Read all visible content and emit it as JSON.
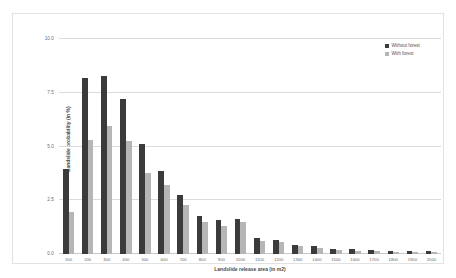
{
  "chart_data": {
    "type": "bar",
    "title": "",
    "subtitle": "",
    "xlabel": "Landslide release area (in m2)",
    "ylabel": "Landslide probability (in %)",
    "categories": [
      "100",
      "200",
      "300",
      "400",
      "500",
      "600",
      "700",
      "800",
      "900",
      "1000",
      "1100",
      "1200",
      "1300",
      "1400",
      "1500",
      "1600",
      "1700",
      "1800",
      "1900",
      "2000"
    ],
    "series": [
      {
        "name": "Without forest",
        "color": "#3b3b3b",
        "values": [
          3.95,
          8.2,
          8.3,
          7.2,
          5.1,
          3.85,
          2.75,
          1.75,
          1.6,
          1.65,
          0.75,
          0.65,
          0.4,
          0.35,
          0.25,
          0.22,
          0.18,
          0.16,
          0.14,
          0.12
        ]
      },
      {
        "name": "With forest",
        "color": "#b6b6b6",
        "values": [
          1.95,
          5.3,
          5.95,
          5.25,
          3.75,
          3.2,
          2.3,
          1.5,
          1.3,
          1.5,
          0.6,
          0.55,
          0.35,
          0.28,
          0.18,
          0.15,
          0.12,
          0.11,
          0.1,
          0.08
        ]
      }
    ],
    "ylim": [
      0,
      10
    ],
    "yticks": [
      "0.0",
      "2.5",
      "5.0",
      "7.5",
      "10.0"
    ],
    "ytick_values": [
      0,
      2.5,
      5,
      7.5,
      10
    ],
    "grid": true,
    "legend_position": "top-right"
  }
}
